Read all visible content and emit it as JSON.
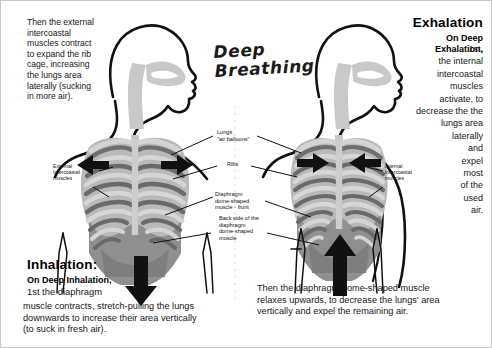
{
  "diagram": {
    "title_script": "Deep\nBreathing",
    "background_color": "#ffffff",
    "ink_color": "#111111"
  },
  "inhalation_panel": {
    "top_text": "Then the external\nintercoastal\nmuscles contract\nto expand the rib\ncage, increasing\nthe lungs area\nlaterally (sucking\nin more air).",
    "heading": "Inhalation:",
    "subhead": "On Deep Inhalation,",
    "line2": " 1st the diaphragm",
    "body": "muscle contracts, stretch-pulling the lungs\ndownwards to increase their area vertically\n(to suck in fresh air)."
  },
  "exhalation_panel": {
    "heading": "Exhalation",
    "subhead": "On Deep",
    "subhead2": "Exhalation,",
    "body": "1st,\nthe internal\nintercoastal\nmuscles\nactivate, to\ndecrease the the\nlungs area\nlaterally\nand\nexpel\nmost\nof the\nused\nair.",
    "bottom_text": "Then the diaphragm dome-shaped muscle\nrelaxes upwards, to decrease the lungs' area\nvertically and expel the remaining air."
  },
  "callouts": {
    "external_intercostal": "External\nIntercoastal\nmuscles",
    "internal_intercostal": "Internal\nIntercoastal\nmuscles",
    "lungs": "Lungs\n\"air balloons\"",
    "ribs": "Ribs",
    "diaphragm_front": "Diaphragm\ndome-shaped\nmuscle - front",
    "diaphragm_back": "Back side of the\ndiaphragm\ndome-shaped\nmuscle"
  },
  "figures": {
    "left": {
      "name": "inhalation-figure",
      "arrow_direction": "down",
      "side_arrows": "outward"
    },
    "right": {
      "name": "exhalation-figure",
      "arrow_direction": "up",
      "side_arrows": "inward"
    }
  },
  "palette": {
    "outline": "#111111",
    "rib_light": "#cfcfcf",
    "rib_dark": "#6e6e6e",
    "lung_fill": "#b7b7b7",
    "diaphragm": "#8a8a8a",
    "spine": "#c4c4c4",
    "arrow": "#111111"
  }
}
